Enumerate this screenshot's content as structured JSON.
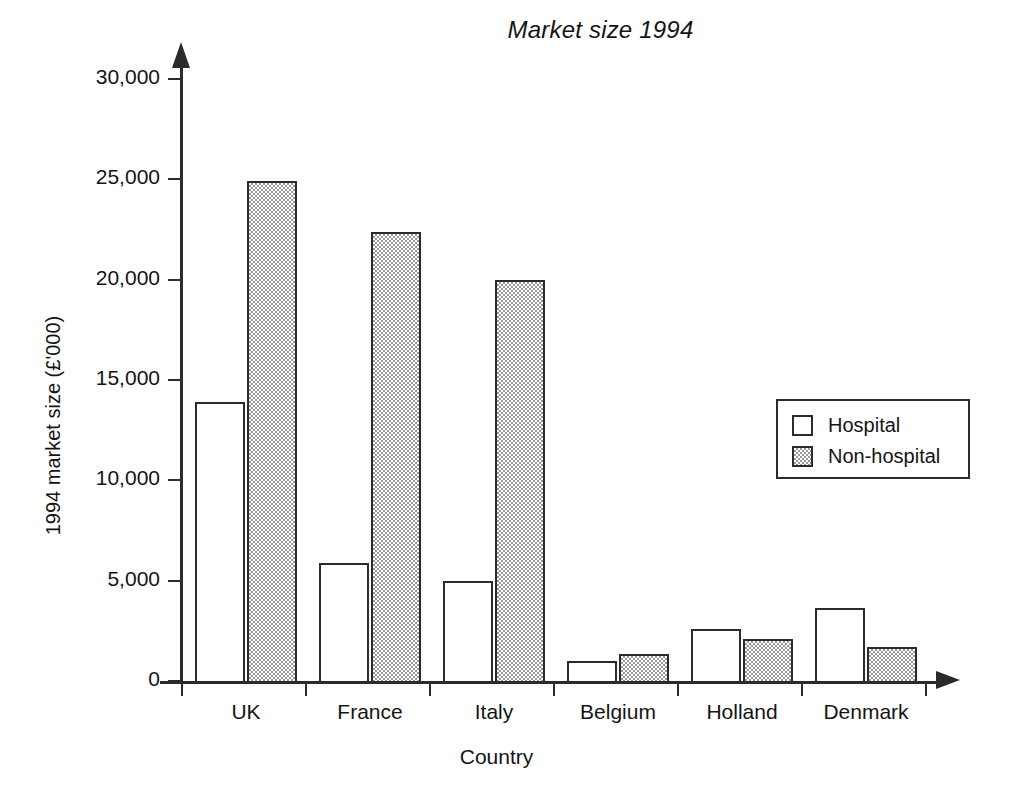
{
  "chart_data": {
    "type": "bar",
    "title": "Market size 1994",
    "xlabel": "Country",
    "ylabel": "1994 market size (£'000)",
    "categories": [
      "UK",
      "France",
      "Italy",
      "Belgium",
      "Holland",
      "Denmark"
    ],
    "series": [
      {
        "name": "Hospital",
        "values": [
          14000,
          6000,
          5100,
          1100,
          2700,
          3750
        ]
      },
      {
        "name": "Non-hospital",
        "values": [
          25000,
          22500,
          20100,
          1450,
          2200,
          1800
        ]
      }
    ],
    "ylim": [
      0,
      30000
    ],
    "ytick_values": [
      0,
      5000,
      10000,
      15000,
      20000,
      25000,
      30000
    ],
    "ytick_labels": [
      "0",
      "5,000",
      "10,000",
      "15,000",
      "20,000",
      "25,000",
      "30,000"
    ],
    "grid": false,
    "legend_position": "right-middle",
    "colors": {
      "axis": "#2b2b2b",
      "text": "#141414",
      "hospital_fill": "#ffffff",
      "nonhospital_fill": "#9a9a9a",
      "bar_outline": "#2b2b2b"
    }
  },
  "legend": {
    "entries": [
      {
        "label": "Hospital",
        "swatch": "hospital"
      },
      {
        "label": "Non-hospital",
        "swatch": "nonhospital"
      }
    ]
  }
}
